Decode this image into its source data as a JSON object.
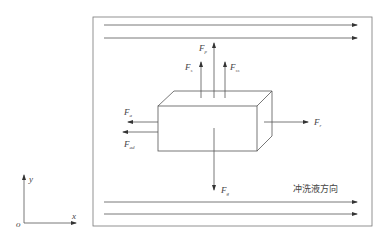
{
  "diagram": {
    "colors": {
      "line": "#555555",
      "text": "#444444",
      "background": "#ffffff"
    },
    "forces": {
      "fp": {
        "main": "F",
        "sub": "p"
      },
      "fs": {
        "main": "F",
        "sub": "s"
      },
      "fss": {
        "main": "F",
        "sub": "ss"
      },
      "fa": {
        "main": "F",
        "sub": "a"
      },
      "fad": {
        "main": "F",
        "sub": "ad"
      },
      "fr": {
        "main": "F",
        "sub": "r"
      },
      "fg": {
        "main": "F",
        "sub": "g"
      }
    },
    "flow_label": "冲洗液方向",
    "axes": {
      "origin": "o",
      "x": "x",
      "y": "y"
    }
  }
}
